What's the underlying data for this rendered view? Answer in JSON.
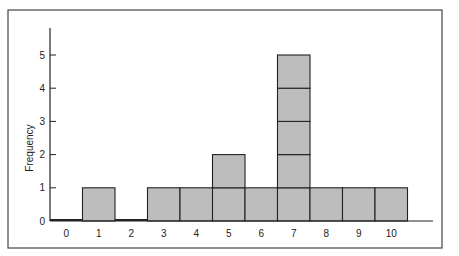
{
  "chart_data": {
    "type": "bar",
    "subtype": "histogram (stacked unit squares)",
    "title": "",
    "xlabel": "",
    "ylabel": "Frequency",
    "categories": [
      "0",
      "1",
      "2",
      "3",
      "4",
      "5",
      "6",
      "7",
      "8",
      "9",
      "10"
    ],
    "values": [
      0,
      1,
      0,
      1,
      1,
      2,
      1,
      5,
      1,
      1,
      1
    ],
    "yticks": [
      "0",
      "1",
      "2",
      "3",
      "4",
      "5"
    ],
    "ylim": [
      0,
      5.8
    ],
    "grid": false,
    "legend": null,
    "bar_color": "#bdbdbd",
    "edge_color": "#222222"
  }
}
